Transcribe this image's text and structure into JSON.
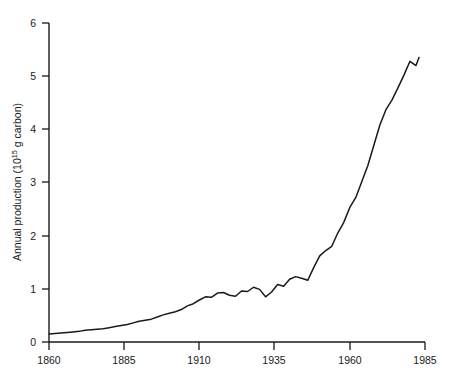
{
  "chart_data": {
    "type": "line",
    "title": "",
    "xlabel": "",
    "ylabel": "Annual production (10^15 g carbon)",
    "ylabel_main": "Annual production (10",
    "ylabel_exponent": "15",
    "ylabel_tail": "g carbon)",
    "xlim": [
      1860,
      1985
    ],
    "ylim": [
      0,
      6
    ],
    "xticks": [
      1860,
      1885,
      1910,
      1935,
      1960,
      1985
    ],
    "yticks": [
      0,
      1,
      2,
      3,
      4,
      5,
      6
    ],
    "xtick_labels": [
      "1860",
      "1885",
      "1910",
      "1935",
      "1960",
      "1985"
    ],
    "ytick_labels": [
      "0",
      "1",
      "2",
      "3",
      "4",
      "5",
      "6"
    ],
    "grid": false,
    "legend": false,
    "line_color": "#1a1a1a",
    "background_color": "#ffffff",
    "series": [
      {
        "name": "Annual carbon production",
        "x": [
          1860,
          1862,
          1864,
          1866,
          1868,
          1870,
          1872,
          1874,
          1876,
          1878,
          1880,
          1882,
          1884,
          1886,
          1888,
          1890,
          1892,
          1894,
          1896,
          1898,
          1900,
          1902,
          1904,
          1906,
          1908,
          1910,
          1912,
          1914,
          1916,
          1918,
          1920,
          1922,
          1924,
          1926,
          1928,
          1930,
          1932,
          1934,
          1936,
          1938,
          1940,
          1942,
          1944,
          1946,
          1948,
          1950,
          1952,
          1954,
          1956,
          1958,
          1960,
          1962,
          1964,
          1966,
          1968,
          1970,
          1972,
          1974,
          1976,
          1978,
          1980,
          1982,
          1983
        ],
        "values": [
          0.15,
          0.16,
          0.17,
          0.18,
          0.19,
          0.2,
          0.22,
          0.23,
          0.24,
          0.25,
          0.27,
          0.29,
          0.31,
          0.33,
          0.36,
          0.39,
          0.41,
          0.43,
          0.47,
          0.51,
          0.54,
          0.57,
          0.61,
          0.68,
          0.72,
          0.79,
          0.85,
          0.84,
          0.92,
          0.93,
          0.88,
          0.86,
          0.96,
          0.95,
          1.03,
          0.99,
          0.85,
          0.94,
          1.08,
          1.05,
          1.18,
          1.23,
          1.2,
          1.16,
          1.4,
          1.62,
          1.72,
          1.8,
          2.05,
          2.25,
          2.53,
          2.72,
          3.02,
          3.32,
          3.7,
          4.08,
          4.37,
          4.55,
          4.78,
          5.02,
          5.28,
          5.2,
          5.35
        ]
      }
    ],
    "annotations": []
  }
}
